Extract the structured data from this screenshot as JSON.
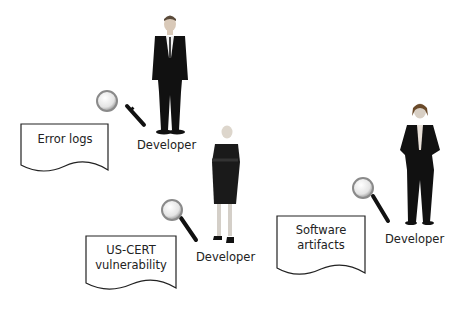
{
  "diagram": {
    "documents": [
      {
        "id": "error-logs",
        "label": "Error logs"
      },
      {
        "id": "us-cert",
        "label_lines": [
          "US-CERT",
          "vulnerability"
        ]
      },
      {
        "id": "software-artifacts",
        "label_lines": [
          "Software",
          "artifacts"
        ]
      }
    ],
    "developers": [
      {
        "id": "dev-1",
        "label": "Developer"
      },
      {
        "id": "dev-2",
        "label": "Developer"
      },
      {
        "id": "dev-3",
        "label": "Developer"
      }
    ],
    "icons": [
      "magnifier-icon",
      "person-figure-icon",
      "document-shape-icon"
    ],
    "colors": {
      "stroke": "#222222",
      "figure": "#111111",
      "skin": "#d9d2c8",
      "lens": "#cfcfcf"
    }
  }
}
